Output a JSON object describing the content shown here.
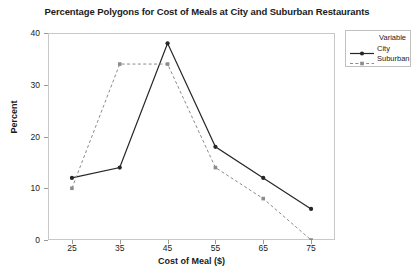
{
  "chart_data": {
    "type": "line",
    "title": "Percentage Polygons for Cost of Meals at City and Suburban Restaurants",
    "xlabel": "Cost of Meal ($)",
    "ylabel": "Percent",
    "x": [
      25,
      35,
      45,
      55,
      65,
      75
    ],
    "xticklabels": [
      "25",
      "35",
      "45",
      "55",
      "65",
      "75"
    ],
    "yticklabels": [
      "0",
      "10",
      "20",
      "30",
      "40"
    ],
    "yticks": [
      0,
      10,
      20,
      30,
      40
    ],
    "ylim": [
      0,
      40
    ],
    "xlim": [
      20,
      80
    ],
    "grid": false,
    "legend_position": "outside-top-right",
    "legend_title": "Variable",
    "series": [
      {
        "name": "City",
        "values": [
          12,
          14,
          38,
          18,
          12,
          6
        ],
        "color": "#262626",
        "linestyle": "solid",
        "marker": "circle"
      },
      {
        "name": "Suburban",
        "values": [
          10,
          34,
          34,
          14,
          8,
          0
        ],
        "color": "#8c8c8c",
        "linestyle": "dashed",
        "marker": "square"
      }
    ]
  }
}
